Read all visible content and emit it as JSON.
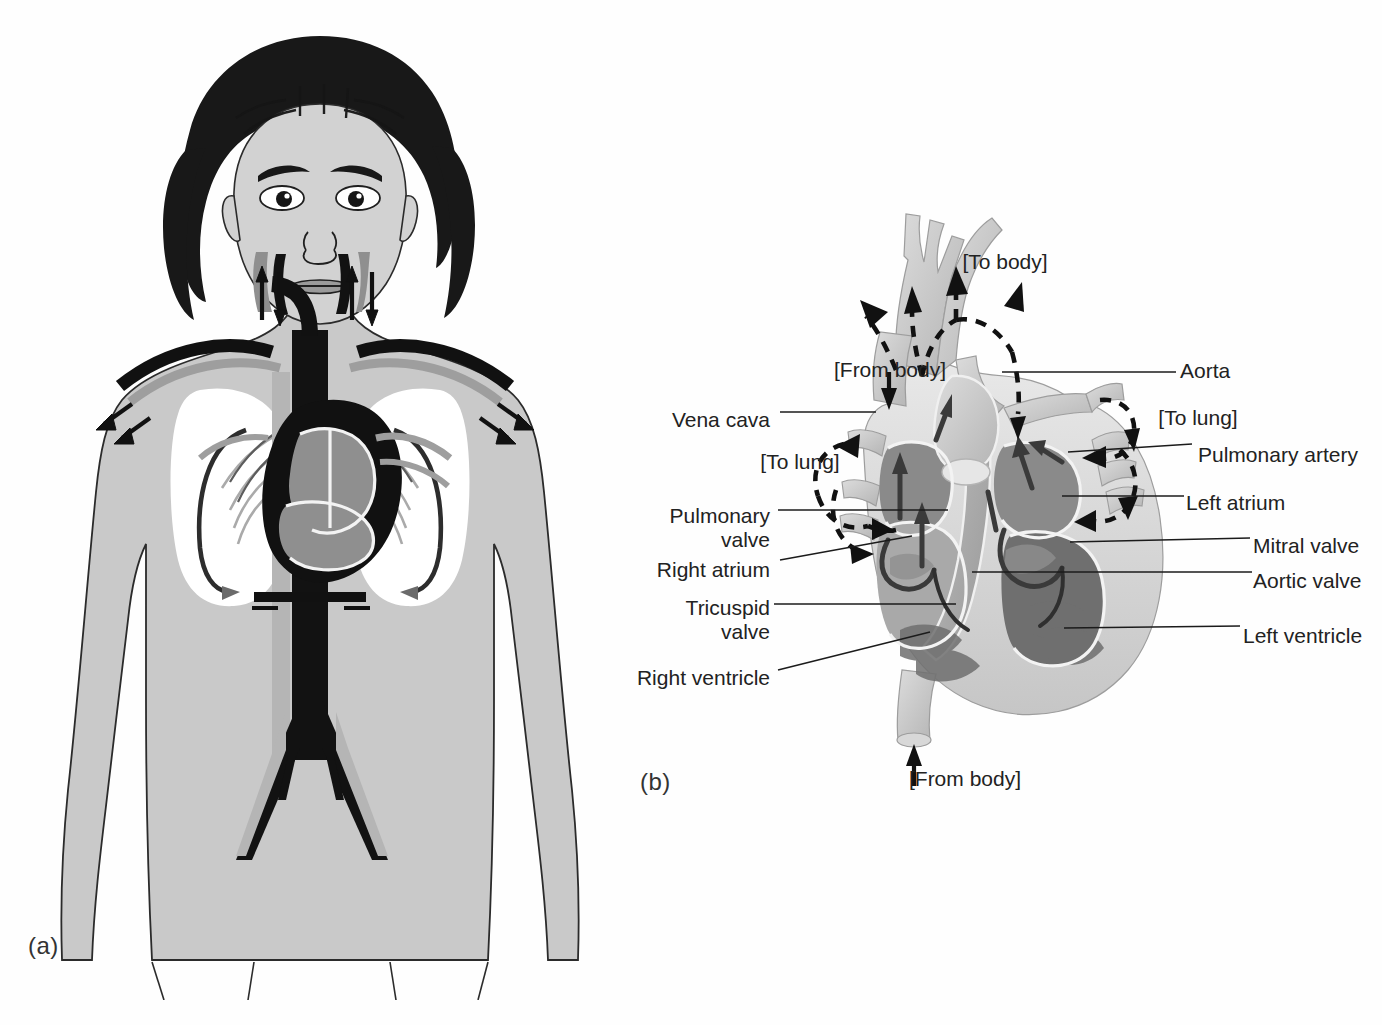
{
  "figure": {
    "panels": [
      {
        "id": "a",
        "label": "(a)",
        "caption_x": 28,
        "caption_y": 944,
        "description": "human-body-circulation-illustration"
      },
      {
        "id": "b",
        "label": "(b)",
        "caption_x": 640,
        "caption_y": 778,
        "description": "heart-cross-section-illustration"
      }
    ]
  },
  "panel_a": {
    "name": "whole-body-circulatory-diagram",
    "organs": [
      "head",
      "neck",
      "shoulders",
      "arms",
      "lungs",
      "heart",
      "aorta",
      "vena-cava",
      "iliac-arteries"
    ],
    "flow_arrows": [
      "neck-up",
      "neck-down",
      "arm-left-out",
      "arm-right-out",
      "lung-left-circuit",
      "lung-right-circuit"
    ]
  },
  "panel_b": {
    "name": "heart-cross-section",
    "labels_left": [
      {
        "text": "Vena cava",
        "x": 690,
        "y": 410,
        "align": "right",
        "leader": "horizontal"
      },
      {
        "text": "Pulmonary\nvalve",
        "x": 628,
        "y": 508,
        "align": "right",
        "leader": "horizontal"
      },
      {
        "text": "Right atrium",
        "x": 636,
        "y": 560,
        "align": "right",
        "leader": "diagonal"
      },
      {
        "text": "Tricuspid\nvalve",
        "x": 614,
        "y": 600,
        "align": "right",
        "leader": "horizontal"
      },
      {
        "text": "Right ventricle",
        "x": 640,
        "y": 668,
        "align": "right",
        "leader": "diagonal"
      }
    ],
    "labels_right": [
      {
        "text": "Aorta",
        "x": 1180,
        "y": 360,
        "align": "left",
        "leader": "horizontal"
      },
      {
        "text": "Pulmonary artery",
        "x": 1198,
        "y": 444,
        "align": "left",
        "leader": "diagonal"
      },
      {
        "text": "Left atrium",
        "x": 1186,
        "y": 492,
        "align": "left",
        "leader": "horizontal"
      },
      {
        "text": "Mitral valve",
        "x": 1253,
        "y": 535,
        "align": "left",
        "leader": "horizontal"
      },
      {
        "text": "Aortic valve",
        "x": 1253,
        "y": 570,
        "align": "left",
        "leader": "horizontal"
      },
      {
        "text": "Left ventricle",
        "x": 1243,
        "y": 625,
        "align": "left",
        "leader": "horizontal"
      }
    ],
    "flow_callouts": [
      {
        "text": "[To body]",
        "x": 1000,
        "y": 252,
        "align": "center"
      },
      {
        "text": "[From body]",
        "x": 889,
        "y": 360,
        "align": "center"
      },
      {
        "text": "[To lung]",
        "x": 798,
        "y": 452,
        "align": "center"
      },
      {
        "text": "[To lung]",
        "x": 1192,
        "y": 408,
        "align": "center"
      },
      {
        "text": "[From body]",
        "x": 963,
        "y": 772,
        "align": "center"
      }
    ]
  },
  "colors": {
    "background": "#fefefe",
    "text": "#222222",
    "leader_line": "#1b1b1b",
    "arrow": "#111111",
    "body_fill": "#c9c9c9",
    "lung_fill": "#ffffff",
    "vessel_dark": "#121212",
    "vessel_light": "#b5b5b5",
    "heart_mid": "#a9a9a9",
    "heart_pale": "#e3e3e3"
  }
}
